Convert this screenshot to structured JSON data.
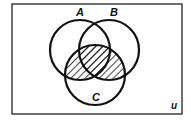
{
  "diagram": {
    "type": "venn",
    "universal_label": "u",
    "sets": [
      {
        "label": "A",
        "cx": 80,
        "cy": 50,
        "r": 30
      },
      {
        "label": "B",
        "cx": 109,
        "cy": 50,
        "r": 30
      },
      {
        "label": "C",
        "cx": 95,
        "cy": 75,
        "r": 30
      }
    ],
    "shaded_region": "(A ∪ B) ∩ C",
    "shading_style": "diagonal-hatch",
    "colors": {
      "stroke": "#111111",
      "background": "#ffffff",
      "hatch": "#111111"
    }
  }
}
